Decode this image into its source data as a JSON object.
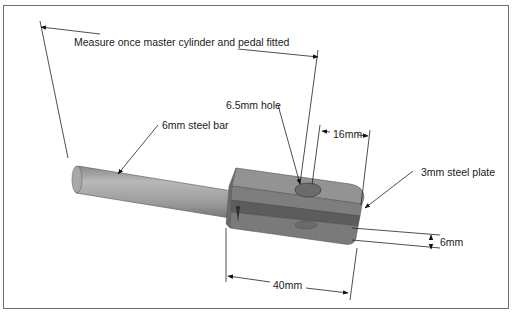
{
  "diagram": {
    "labels": {
      "measure_note": "Measure once master cylinder and pedal fitted",
      "bar": "6mm steel bar",
      "hole": "6.5mm hole",
      "offset": "16mm",
      "plate": "3mm steel plate",
      "gap": "6mm",
      "length": "40mm"
    },
    "colors": {
      "frame": "#6e6e6e",
      "line": "#1a1a1a",
      "bar_light": "#b5b5b5",
      "bar_dark": "#7d7d7d",
      "body_top": "#8e8e8e",
      "body_front": "#767676",
      "body_dark": "#5a5a5a",
      "hole": "#6a6a6a"
    }
  }
}
